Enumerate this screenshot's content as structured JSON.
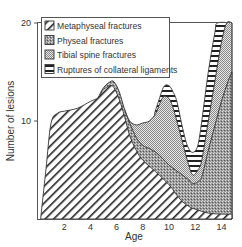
{
  "chart_data": {
    "type": "area",
    "stacked": true,
    "title": "",
    "xlabel": "Age",
    "ylabel": "Number of lesions",
    "xlim": [
      0,
      14.8
    ],
    "ylim": [
      0,
      20
    ],
    "x_ticks": [
      2,
      4,
      6,
      8,
      10,
      12,
      14
    ],
    "y_ticks": [
      10,
      20
    ],
    "grid": false,
    "legend_position": "top-left inside",
    "series": [
      {
        "name": "Metaphyseal fractures",
        "pattern": "diagonal-hatch",
        "top": [
          [
            0.2,
            0
          ],
          [
            0.6,
            5
          ],
          [
            1,
            9.8
          ],
          [
            1.5,
            10.8
          ],
          [
            2,
            11
          ],
          [
            3,
            11.3
          ],
          [
            4,
            12
          ],
          [
            4.6,
            12.4
          ],
          [
            5,
            13.2
          ],
          [
            5.5,
            13.6
          ],
          [
            5.8,
            13.4
          ],
          [
            6.2,
            12.2
          ],
          [
            6.6,
            10.5
          ],
          [
            7,
            8.5
          ],
          [
            7.5,
            7
          ],
          [
            8,
            6
          ],
          [
            9,
            4.8
          ],
          [
            10,
            3.5
          ],
          [
            10.5,
            2.6
          ],
          [
            11,
            1.8
          ],
          [
            11.5,
            1.3
          ],
          [
            12,
            1
          ],
          [
            13,
            0.6
          ],
          [
            14,
            0.5
          ],
          [
            14.8,
            0.5
          ]
        ]
      },
      {
        "name": "Physeal fractures",
        "pattern": "fine-stipple",
        "top": [
          [
            4.6,
            12.4
          ],
          [
            5,
            13.4
          ],
          [
            5.5,
            14
          ],
          [
            5.8,
            14
          ],
          [
            6.2,
            13
          ],
          [
            6.6,
            11.2
          ],
          [
            7,
            9.8
          ],
          [
            7.5,
            8.3
          ],
          [
            8,
            7.5
          ],
          [
            8.5,
            7.2
          ],
          [
            9,
            6.8
          ],
          [
            9.5,
            6.2
          ],
          [
            10,
            5.5
          ],
          [
            10.5,
            5
          ],
          [
            11,
            4.5
          ],
          [
            11.5,
            4
          ],
          [
            11.8,
            3.6
          ],
          [
            12.2,
            3.8
          ],
          [
            12.5,
            4.3
          ],
          [
            13,
            7
          ],
          [
            13.5,
            9.5
          ],
          [
            14,
            12
          ],
          [
            14.5,
            14
          ],
          [
            14.8,
            15
          ]
        ]
      },
      {
        "name": "Tibial spine fractures",
        "pattern": "checker-dot",
        "top": [
          [
            6.6,
            11.2
          ],
          [
            7,
            10
          ],
          [
            7.5,
            9.6
          ],
          [
            8,
            9.8
          ],
          [
            8.5,
            10
          ],
          [
            9,
            10.8
          ],
          [
            9.3,
            11.8
          ],
          [
            9.6,
            12.5
          ],
          [
            10,
            12.3
          ],
          [
            10.3,
            11.4
          ],
          [
            10.6,
            10
          ],
          [
            11,
            8
          ],
          [
            11.4,
            6
          ],
          [
            11.8,
            4.5
          ],
          [
            12.2,
            5
          ],
          [
            12.5,
            6
          ],
          [
            13,
            10
          ],
          [
            13.5,
            14
          ],
          [
            14,
            18
          ],
          [
            14.4,
            20
          ],
          [
            14.8,
            20
          ]
        ]
      },
      {
        "name": "Ruptures of collateral ligaments",
        "pattern": "horizontal-stripes",
        "top": [
          [
            8.9,
            10.8
          ],
          [
            9.2,
            12
          ],
          [
            9.6,
            13.5
          ],
          [
            10,
            13.6
          ],
          [
            10.3,
            13
          ],
          [
            10.6,
            12
          ],
          [
            11,
            9.5
          ],
          [
            11.4,
            7.5
          ],
          [
            11.8,
            6.8
          ],
          [
            12.2,
            7.5
          ],
          [
            12.5,
            10
          ],
          [
            13,
            15
          ],
          [
            13.5,
            19
          ],
          [
            13.7,
            20
          ],
          [
            14.8,
            20
          ]
        ]
      }
    ]
  },
  "axes": {
    "xlabel": "Age",
    "ylabel": "Number of lesions",
    "x_tick_labels": [
      "2",
      "4",
      "6",
      "8",
      "10",
      "12",
      "14"
    ],
    "y_tick_labels": [
      "10",
      "20"
    ]
  },
  "legend": {
    "items": [
      {
        "label": "Metaphyseal fractures",
        "pattern": "diagonal-hatch"
      },
      {
        "label": "Physeal fractures",
        "pattern": "fine-stipple"
      },
      {
        "label": "Tibial spine fractures",
        "pattern": "checker-dot"
      },
      {
        "label": "Ruptures of collateral ligaments",
        "pattern": "horizontal-stripes"
      }
    ]
  }
}
